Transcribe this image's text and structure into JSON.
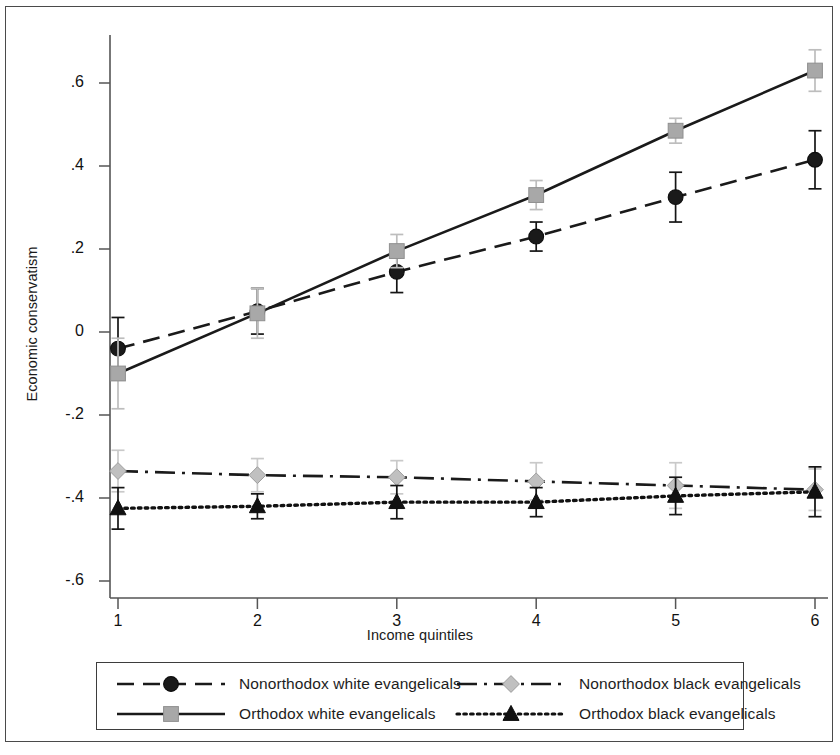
{
  "chart_data": {
    "type": "line",
    "title": "",
    "subtitle": "",
    "xlabel": "Income quintiles",
    "ylabel": "Economic conservatism",
    "x": [
      1,
      2,
      3,
      4,
      5,
      6
    ],
    "xtick_labels": [
      "1",
      "2",
      "3",
      "4",
      "5",
      "6"
    ],
    "ytick_labels": [
      ".6",
      ".4",
      ".2",
      "0",
      "-.2",
      "-.4",
      "-.6"
    ],
    "ytick_values": [
      0.6,
      0.4,
      0.2,
      0,
      -0.2,
      -0.4,
      -0.6
    ],
    "xlim": [
      1,
      6
    ],
    "ylim": [
      -0.6,
      0.68
    ],
    "grid": false,
    "legend_position": "bottom",
    "error_bars": true,
    "series": [
      {
        "name": "Nonorthodox white evangelicals",
        "marker": "circle",
        "marker_color": "#1a1a1a",
        "line_style": "dashed",
        "line_color": "#1a1a1a",
        "values": [
          -0.04,
          0.05,
          0.145,
          0.23,
          0.325,
          0.415
        ],
        "err_low": [
          -0.115,
          -0.005,
          0.095,
          0.195,
          0.265,
          0.345
        ],
        "err_high": [
          0.035,
          0.105,
          0.195,
          0.265,
          0.385,
          0.485
        ]
      },
      {
        "name": "Orthodox white evangelicals",
        "marker": "square",
        "marker_color": "#a8a8a8",
        "line_style": "solid",
        "line_color": "#1a1a1a",
        "values": [
          -0.1,
          0.045,
          0.195,
          0.33,
          0.485,
          0.63
        ],
        "err_low": [
          -0.185,
          -0.015,
          0.155,
          0.295,
          0.455,
          0.58
        ],
        "err_high": [
          -0.015,
          0.105,
          0.235,
          0.365,
          0.515,
          0.68
        ]
      },
      {
        "name": "Nonorthodox black evangelicals",
        "marker": "diamond",
        "marker_color": "#c0c0c0",
        "line_style": "dashdot",
        "line_color": "#1a1a1a",
        "values": [
          -0.335,
          -0.345,
          -0.35,
          -0.36,
          -0.37,
          -0.38
        ],
        "err_low": [
          -0.385,
          -0.385,
          -0.39,
          -0.405,
          -0.425,
          -0.43
        ],
        "err_high": [
          -0.285,
          -0.305,
          -0.31,
          -0.315,
          -0.315,
          -0.33
        ]
      },
      {
        "name": "Orthodox black evangelicals",
        "marker": "triangle",
        "marker_color": "#111111",
        "line_style": "dotted",
        "line_color": "#111111",
        "values": [
          -0.425,
          -0.42,
          -0.41,
          -0.41,
          -0.395,
          -0.385
        ],
        "err_low": [
          -0.475,
          -0.45,
          -0.45,
          -0.445,
          -0.44,
          -0.445
        ],
        "err_high": [
          -0.375,
          -0.39,
          -0.37,
          -0.375,
          -0.35,
          -0.325
        ]
      }
    ]
  },
  "legend": {
    "entries": [
      {
        "label": "Nonorthodox white evangelicals"
      },
      {
        "label": "Orthodox white evangelicals"
      },
      {
        "label": "Nonorthodox black evangelicals"
      },
      {
        "label": "Orthodox black evangelicals"
      }
    ]
  }
}
